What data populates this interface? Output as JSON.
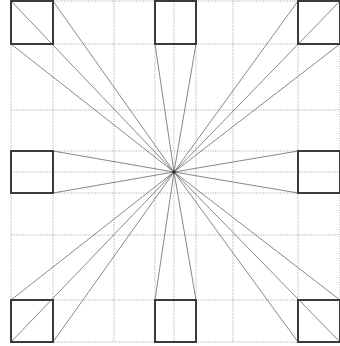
{
  "diagram": {
    "title": "",
    "type": "one-point perspective construction",
    "vanishing_point": {
      "x": 174,
      "y": 172
    },
    "colors": {
      "box": "#3a3a3a",
      "ray": "#6a6a6a",
      "grid": "#9a9a9a",
      "background": "#ffffff"
    },
    "boxes": [
      {
        "id": "top-left",
        "x": 11,
        "y": 1,
        "w": 42,
        "h": 43
      },
      {
        "id": "top-center",
        "x": 155,
        "y": 1,
        "w": 41,
        "h": 43
      },
      {
        "id": "top-right",
        "x": 298,
        "y": 1,
        "w": 42,
        "h": 43
      },
      {
        "id": "middle-left",
        "x": 11,
        "y": 151,
        "w": 42,
        "h": 42
      },
      {
        "id": "middle-right",
        "x": 298,
        "y": 151,
        "w": 42,
        "h": 42
      },
      {
        "id": "bottom-left",
        "x": 11,
        "y": 300,
        "w": 42,
        "h": 42
      },
      {
        "id": "bottom-center",
        "x": 155,
        "y": 300,
        "w": 41,
        "h": 42
      },
      {
        "id": "bottom-right",
        "x": 298,
        "y": 300,
        "w": 42,
        "h": 42
      }
    ],
    "grid_vertical": [
      11,
      53,
      114,
      155,
      174,
      196,
      233,
      298,
      340
    ],
    "grid_horizontal": [
      1,
      44,
      110,
      151,
      172,
      193,
      235,
      300,
      342
    ]
  }
}
